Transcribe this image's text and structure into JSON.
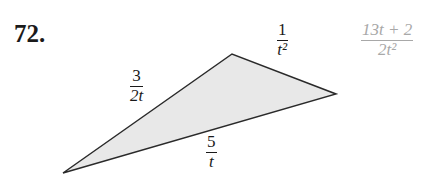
{
  "problem": {
    "number": "72.",
    "answer": {
      "numerator": "13t + 2",
      "denominator": "2t²"
    }
  },
  "triangle": {
    "vertices": {
      "left": [
        63,
        173
      ],
      "top": [
        232,
        54
      ],
      "right": [
        336,
        94
      ]
    },
    "fill_color": "#e8e8e8",
    "stroke_color": "#2a2a2a",
    "sides": {
      "left_top": {
        "numerator": "3",
        "denominator": "2t"
      },
      "top_right": {
        "numerator": "1",
        "denominator": "t²"
      },
      "bottom": {
        "numerator": "5",
        "denominator": "t"
      }
    }
  }
}
